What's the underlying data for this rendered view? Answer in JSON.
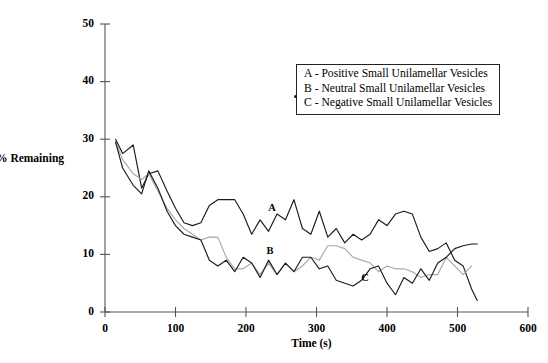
{
  "chart_data": {
    "type": "line",
    "title": "",
    "xlabel": "Time (s)",
    "ylabel": "% Remaining",
    "xlim": [
      0,
      600
    ],
    "ylim": [
      0,
      50
    ],
    "xticks": [
      0,
      100,
      200,
      300,
      400,
      500,
      600
    ],
    "yticks": [
      0,
      10,
      20,
      30,
      40,
      50
    ],
    "grid": false,
    "legend_position": "top-right",
    "legend": [
      "A - Positive Small Unilamellar Vesicles",
      "B - Neutral Small Unilamellar Vesicles",
      "C - Negative Small Unilamellar Vesicles"
    ],
    "annotations": [
      {
        "text": "A",
        "x": 237,
        "y": 17.5
      },
      {
        "text": "B",
        "x": 234,
        "y": 10.1
      },
      {
        "text": "C",
        "x": 369,
        "y": 5.3
      }
    ],
    "colors": {
      "A": "#1b1b1b",
      "B": "#a8a8a8",
      "C": "#1b1b1b"
    },
    "series": [
      {
        "name": "A - Positive Small Unilamellar Vesicles",
        "color": "#1b1b1b",
        "x": [
          15,
          25,
          40,
          52,
          62,
          75,
          88,
          100,
          112,
          124,
          136,
          148,
          160,
          172,
          184,
          196,
          208,
          220,
          232,
          244,
          256,
          268,
          280,
          292,
          304,
          316,
          328,
          340,
          352,
          364,
          376,
          388,
          400,
          412,
          424,
          436,
          448,
          460,
          472,
          484,
          496,
          508,
          520,
          528
        ],
        "values": [
          30.0,
          27.5,
          29.0,
          21.5,
          24.0,
          24.5,
          21.0,
          18.0,
          15.5,
          15.0,
          15.5,
          18.5,
          19.5,
          19.5,
          19.5,
          17.0,
          13.5,
          16.0,
          14.0,
          17.0,
          16.0,
          19.5,
          14.5,
          13.5,
          17.5,
          13.0,
          14.5,
          12.0,
          13.5,
          12.5,
          13.5,
          16.0,
          15.0,
          17.0,
          17.5,
          17.0,
          13.0,
          10.5,
          11.0,
          12.0,
          9.0,
          8.0,
          4.0,
          2.0
        ]
      },
      {
        "name": "B - Neutral Small Unilamellar Vesicles",
        "color": "#a8a8a8",
        "x": [
          15,
          25,
          40,
          52,
          62,
          75,
          88,
          100,
          112,
          124,
          136,
          148,
          160,
          172,
          184,
          196,
          208,
          220,
          232,
          244,
          256,
          268,
          280,
          292,
          304,
          316,
          328,
          340,
          352,
          364,
          376,
          388,
          400,
          412,
          424,
          436,
          448,
          460,
          472,
          484,
          496,
          508,
          520
        ],
        "values": [
          29.5,
          26.5,
          24.0,
          23.0,
          24.0,
          21.0,
          18.0,
          16.0,
          14.5,
          13.5,
          12.5,
          13.0,
          13.0,
          9.5,
          7.5,
          7.5,
          8.5,
          6.5,
          8.5,
          6.5,
          8.5,
          7.0,
          8.0,
          9.5,
          9.0,
          11.5,
          11.5,
          11.0,
          9.5,
          9.0,
          8.5,
          7.0,
          8.0,
          7.5,
          7.5,
          7.0,
          6.0,
          6.5,
          6.5,
          9.5,
          8.0,
          6.5,
          8.0
        ]
      },
      {
        "name": "C - Negative Small Unilamellar Vesicles",
        "color": "#1b1b1b",
        "x": [
          15,
          25,
          40,
          52,
          62,
          75,
          88,
          100,
          112,
          124,
          136,
          148,
          160,
          172,
          184,
          196,
          208,
          220,
          232,
          244,
          256,
          268,
          280,
          292,
          304,
          316,
          328,
          340,
          352,
          364,
          376,
          388,
          400,
          412,
          424,
          436,
          448,
          460,
          472,
          484,
          496,
          508,
          520,
          528
        ],
        "values": [
          29.5,
          25.0,
          22.0,
          20.5,
          24.5,
          21.5,
          17.5,
          15.0,
          13.5,
          13.0,
          12.5,
          9.0,
          8.0,
          9.0,
          7.0,
          9.5,
          8.5,
          6.0,
          9.0,
          6.5,
          8.5,
          7.0,
          9.5,
          9.5,
          7.5,
          8.0,
          5.5,
          5.0,
          4.5,
          5.5,
          7.5,
          8.0,
          5.0,
          3.0,
          6.0,
          5.0,
          7.5,
          5.5,
          8.5,
          9.5,
          11.0,
          11.5,
          11.8,
          11.8
        ]
      }
    ]
  }
}
